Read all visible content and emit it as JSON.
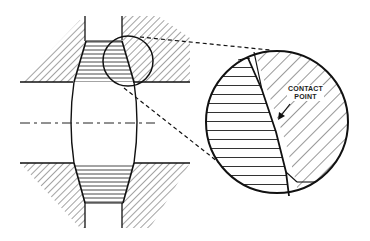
{
  "diagram": {
    "type": "mechanical cross-section with detail magnification",
    "components": [
      "barrel-shaped roller (center)",
      "upper housing (hatched)",
      "lower housing (hatched)",
      "upper contact zone (horizontal hatching)",
      "lower contact zone (horizontal hatching)",
      "centerline (dash-dot)",
      "detail circle (small, at upper right contact)",
      "magnified detail view (large circle)"
    ],
    "callout": {
      "line1": "CONTACT",
      "line2": "POINT"
    },
    "colors": {
      "line": "#111111",
      "background": "#ffffff"
    }
  }
}
